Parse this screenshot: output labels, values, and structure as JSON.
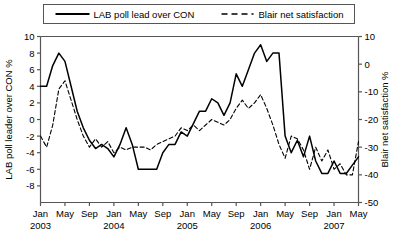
{
  "chart_data": {
    "type": "line",
    "title": "",
    "xlabel": "",
    "ylabel": "LAB poll leader over CON %",
    "y2label": "Blair net satisfaction %",
    "grid": false,
    "legend_position": "top",
    "ylim": [
      -10,
      10
    ],
    "y2lim": [
      -50,
      10
    ],
    "yticks": [
      10,
      8,
      6,
      4,
      2,
      0,
      -2,
      -4,
      -6,
      -8
    ],
    "ytick_labels": [
      "10",
      "8",
      "6",
      "4",
      "2",
      "0",
      "-2",
      "-4",
      "-6",
      "-8"
    ],
    "y2ticks": [
      10,
      0,
      -10,
      -20,
      -30,
      -40,
      -50
    ],
    "y2tick_labels": [
      "10",
      "0",
      "-10",
      "-20",
      "-30",
      "-40",
      "-50"
    ],
    "xlim": [
      "2003-01",
      "2007-05"
    ],
    "xticks": [
      "2003-01",
      "2003-05",
      "2003-09",
      "2004-01",
      "2004-05",
      "2004-09",
      "2005-01",
      "2005-05",
      "2005-09",
      "2006-01",
      "2006-05",
      "2006-09",
      "2007-01",
      "2007-05"
    ],
    "xtick_labels": [
      "Jan",
      "May",
      "Sep",
      "Jan",
      "May",
      "Sep",
      "Jan",
      "May",
      "Sep",
      "Jan",
      "May",
      "Sep",
      "Jan",
      "May"
    ],
    "year_labels": [
      {
        "text": "2003",
        "at": "2003-01"
      },
      {
        "text": "2004",
        "at": "2004-01"
      },
      {
        "text": "2005",
        "at": "2005-01"
      },
      {
        "text": "2006",
        "at": "2006-01"
      },
      {
        "text": "2007",
        "at": "2007-01"
      }
    ],
    "series": [
      {
        "name": "LAB poll lead over CON",
        "axis": "left",
        "style": "solid",
        "color": "#000000",
        "x": [
          "2003-01",
          "2003-02",
          "2003-03",
          "2003-04",
          "2003-05",
          "2003-06",
          "2003-07",
          "2003-08",
          "2003-09",
          "2003-10",
          "2003-11",
          "2003-12",
          "2004-01",
          "2004-02",
          "2004-03",
          "2004-04",
          "2004-05",
          "2004-06",
          "2004-07",
          "2004-08",
          "2004-09",
          "2004-10",
          "2004-11",
          "2004-12",
          "2005-01",
          "2005-02",
          "2005-03",
          "2005-04",
          "2005-05",
          "2005-06",
          "2005-07",
          "2005-08",
          "2005-09",
          "2005-10",
          "2005-11",
          "2005-12",
          "2006-01",
          "2006-02",
          "2006-03",
          "2006-04",
          "2006-05",
          "2006-06",
          "2006-07",
          "2006-08",
          "2006-09",
          "2006-10",
          "2006-11",
          "2006-12",
          "2007-01",
          "2007-02",
          "2007-03",
          "2007-04",
          "2007-05"
        ],
        "values": [
          4.0,
          4.0,
          6.5,
          8.0,
          7.0,
          4.0,
          1.0,
          -1.0,
          -2.5,
          -3.5,
          -3.0,
          -3.5,
          -4.5,
          -3.0,
          -1.0,
          -3.0,
          -6.0,
          -6.0,
          -6.0,
          -6.0,
          -4.0,
          -3.0,
          -3.0,
          -1.5,
          -2.0,
          -0.5,
          1.0,
          1.0,
          2.5,
          2.0,
          0.5,
          2.0,
          5.5,
          4.0,
          6.0,
          8.0,
          9.0,
          7.0,
          8.0,
          8.0,
          -2.0,
          -4.0,
          -2.5,
          -4.5,
          -2.0,
          -5.0,
          -6.5,
          -6.5,
          -5.0,
          -6.5,
          -6.5,
          -5.5,
          -4.5
        ]
      },
      {
        "name": "Blair net satisfaction",
        "axis": "right",
        "style": "dashed",
        "color": "#000000",
        "x": [
          "2003-01",
          "2003-02",
          "2003-03",
          "2003-04",
          "2003-05",
          "2003-06",
          "2003-07",
          "2003-08",
          "2003-09",
          "2003-10",
          "2003-11",
          "2003-12",
          "2004-01",
          "2004-02",
          "2004-03",
          "2004-04",
          "2004-05",
          "2004-06",
          "2004-07",
          "2004-08",
          "2004-09",
          "2004-10",
          "2004-11",
          "2004-12",
          "2005-01",
          "2005-02",
          "2005-03",
          "2005-04",
          "2005-05",
          "2005-06",
          "2005-07",
          "2005-08",
          "2005-09",
          "2005-10",
          "2005-11",
          "2005-12",
          "2006-01",
          "2006-02",
          "2006-03",
          "2006-04",
          "2006-05",
          "2006-06",
          "2006-07",
          "2006-08",
          "2006-09",
          "2006-10",
          "2006-11",
          "2006-12",
          "2007-01",
          "2007-02",
          "2007-03",
          "2007-04",
          "2007-05"
        ],
        "values": [
          -26.0,
          -30.0,
          -22.0,
          -9.0,
          -6.0,
          -13.0,
          -20.0,
          -26.0,
          -30.0,
          -27.0,
          -30.0,
          -28.0,
          -32.0,
          -30.0,
          -31.0,
          -30.0,
          -30.0,
          -30.0,
          -31.0,
          -29.0,
          -28.0,
          -27.0,
          -26.0,
          -23.0,
          -24.0,
          -22.0,
          -24.0,
          -22.0,
          -20.0,
          -21.0,
          -22.0,
          -20.0,
          -16.0,
          -13.0,
          -16.0,
          -14.0,
          -11.0,
          -16.0,
          -22.0,
          -29.0,
          -34.0,
          -26.0,
          -27.0,
          -31.0,
          -38.0,
          -30.0,
          -35.0,
          -31.0,
          -38.0,
          -36.0,
          -40.0,
          -40.0,
          -28.0
        ]
      }
    ]
  },
  "legend": {
    "items": [
      {
        "label": "LAB poll lead over CON",
        "style": "solid"
      },
      {
        "label": "Blair net satisfaction",
        "style": "dashed"
      }
    ]
  }
}
